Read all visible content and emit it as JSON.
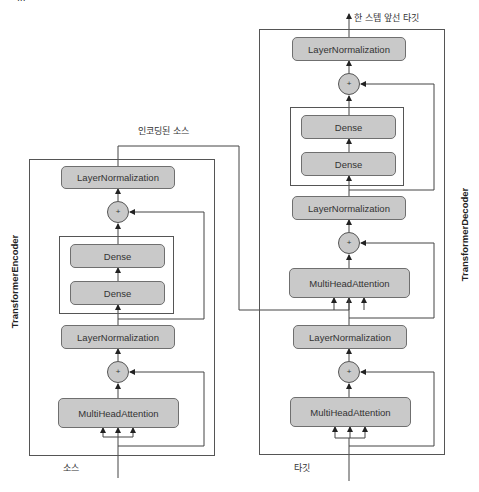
{
  "diagram": {
    "top_cut_label": "...",
    "encoded_source_label": "인코딩된 소스",
    "output_label": "한 스텝 앞선 타깃",
    "encoder": {
      "title": "TransformerEncoder",
      "input_label": "소스",
      "layers": {
        "layer_norm_top": "LayerNormalization",
        "add_top": "+",
        "dense_1": "Dense",
        "dense_2": "Dense",
        "layer_norm_bottom": "LayerNormalization",
        "add_bottom": "+",
        "attention": "MultiHeadAttention"
      }
    },
    "decoder": {
      "title": "TransformerDecoder",
      "input_label": "타깃",
      "layers": {
        "layer_norm_top": "LayerNormalization",
        "add_top": "+",
        "dense_1": "Dense",
        "dense_2": "Dense",
        "layer_norm_mid": "LayerNormalization",
        "add_mid": "+",
        "cross_attention": "MultiHeadAttention",
        "layer_norm_bottom": "LayerNormalization",
        "add_bottom": "+",
        "self_attention": "MultiHeadAttention"
      }
    },
    "colors": {
      "box_fill": "#c9c9c9",
      "box_border": "#6f6f6f",
      "line": "#444444"
    }
  }
}
